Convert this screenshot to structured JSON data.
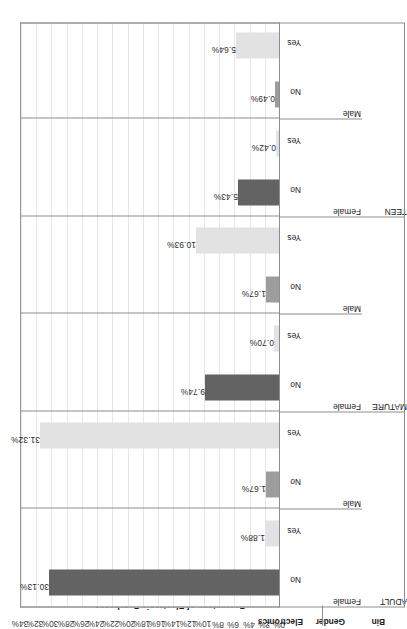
{
  "chart_data": {
    "type": "bar",
    "title": "",
    "xlabel": "",
    "ylabel": "Percentage of Electronic Purchases",
    "ylim": [
      0,
      34
    ],
    "grid": true,
    "legend": "none",
    "orientation": "vertical-bars-rotated-90ccw",
    "y_ticks": [
      "0%",
      "2%",
      "4%",
      "6%",
      "8%",
      "10%",
      "12%",
      "14%",
      "16%",
      "18%",
      "20%",
      "22%",
      "24%",
      "26%",
      "28%",
      "30%",
      "32%",
      "34%"
    ],
    "y_tick_values": [
      0,
      2,
      4,
      6,
      8,
      10,
      12,
      14,
      16,
      18,
      20,
      22,
      24,
      26,
      28,
      30,
      32,
      34
    ],
    "header_labels": [
      "Bin",
      "Gender",
      "Electronics"
    ],
    "categories": [
      "ADULT / Female / No",
      "ADULT / Female / Yes",
      "ADULT / Male / No",
      "ADULT / Male / Yes",
      "MATURE / Female / No",
      "MATURE / Female / Yes",
      "MATURE / Male / No",
      "MATURE / Male / Yes",
      "TEEN / Female / No",
      "TEEN / Female / Yes",
      "TEEN / Male / No",
      "TEEN / Male / Yes"
    ],
    "values": [
      30.13,
      1.88,
      1.67,
      31.32,
      9.74,
      0.7,
      1.67,
      10.93,
      5.43,
      0.42,
      0.49,
      5.64
    ],
    "value_labels": [
      "30.13%",
      "1.88%",
      "1.67%",
      "31.32%",
      "9.74%",
      "0.70%",
      "1.67%",
      "10.93%",
      "5.43%",
      "0.42%",
      "0.49%",
      "5.64%"
    ],
    "bars": [
      {
        "bin": "ADULT",
        "gender": "Female",
        "electronics": "No",
        "value": 30.13,
        "label": "30.13%",
        "color": "#636363",
        "shade": "dark"
      },
      {
        "bin": "ADULT",
        "gender": "Female",
        "electronics": "Yes",
        "value": 1.88,
        "label": "1.88%",
        "color": "#e2e2e2",
        "shade": "light"
      },
      {
        "bin": "ADULT",
        "gender": "Male",
        "electronics": "No",
        "value": 1.67,
        "label": "1.67%",
        "color": "#9d9d9d",
        "shade": "mid"
      },
      {
        "bin": "ADULT",
        "gender": "Male",
        "electronics": "Yes",
        "value": 31.32,
        "label": "31.32%",
        "color": "#e2e2e2",
        "shade": "light"
      },
      {
        "bin": "MATURE",
        "gender": "Female",
        "electronics": "No",
        "value": 9.74,
        "label": "9.74%",
        "color": "#636363",
        "shade": "dark"
      },
      {
        "bin": "MATURE",
        "gender": "Female",
        "electronics": "Yes",
        "value": 0.7,
        "label": "0.70%",
        "color": "#e2e2e2",
        "shade": "light"
      },
      {
        "bin": "MATURE",
        "gender": "Male",
        "electronics": "No",
        "value": 1.67,
        "label": "1.67%",
        "color": "#9d9d9d",
        "shade": "mid"
      },
      {
        "bin": "MATURE",
        "gender": "Male",
        "electronics": "Yes",
        "value": 10.93,
        "label": "10.93%",
        "color": "#e2e2e2",
        "shade": "light"
      },
      {
        "bin": "TEEN",
        "gender": "Female",
        "electronics": "No",
        "value": 5.43,
        "label": "5.43%",
        "color": "#636363",
        "shade": "dark"
      },
      {
        "bin": "TEEN",
        "gender": "Female",
        "electronics": "Yes",
        "value": 0.42,
        "label": "0.42%",
        "color": "#e2e2e2",
        "shade": "light"
      },
      {
        "bin": "TEEN",
        "gender": "Male",
        "electronics": "No",
        "value": 0.49,
        "label": "0.49%",
        "color": "#9d9d9d",
        "shade": "mid"
      },
      {
        "bin": "TEEN",
        "gender": "Male",
        "electronics": "Yes",
        "value": 5.64,
        "label": "5.64%",
        "color": "#e2e2e2",
        "shade": "light"
      }
    ],
    "bin_groups": [
      {
        "label": "ADULT",
        "genders": [
          "Female",
          "Male"
        ]
      },
      {
        "label": "MATURE",
        "genders": [
          "Female",
          "Male"
        ]
      },
      {
        "label": "TEEN",
        "genders": [
          "Female",
          "Male"
        ]
      }
    ],
    "electronics_levels": [
      "No",
      "Yes"
    ],
    "colors": {
      "bar_dark": "#636363",
      "bar_mid": "#9d9d9d",
      "bar_light": "#e2e2e2",
      "gridline": "#e6e6e6",
      "frame": "#8d8d8d",
      "text": "#202020",
      "background": "#ffffff"
    }
  }
}
